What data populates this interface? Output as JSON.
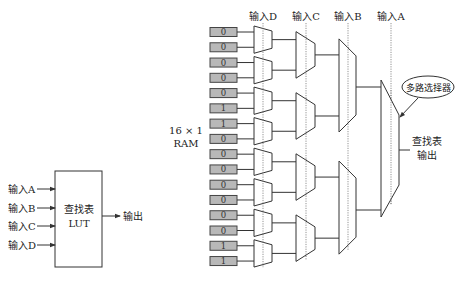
{
  "lut_block": {
    "inputs": [
      "输入A",
      "输入B",
      "输入C",
      "输入D"
    ],
    "title_line1": "查找表",
    "title_line2": "LUT",
    "output_label": "输出"
  },
  "lut_implementation": {
    "ram_label_line1": "16 × 1",
    "ram_label_line2": "RAM",
    "ram_values": [
      "0",
      "0",
      "0",
      "0",
      "0",
      "1",
      "1",
      "0",
      "0",
      "0",
      "0",
      "0",
      "0",
      "0",
      "1",
      "1"
    ],
    "select_inputs": [
      "输入D",
      "输入C",
      "输入B",
      "输入A"
    ],
    "mux_callout": "多路选择器",
    "output_line1": "查找表",
    "output_line2": "输出"
  },
  "colors": {
    "ram_cell_fill": "#b8b8b8",
    "line": "#333333",
    "background": "#ffffff"
  }
}
